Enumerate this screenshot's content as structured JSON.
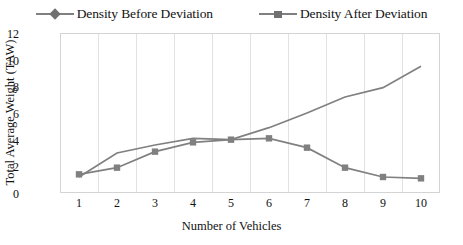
{
  "chart_data": {
    "type": "line",
    "title": "",
    "xlabel": "Number of Vehicles",
    "ylabel": "Total Average Weight (TAW)",
    "x": [
      1,
      2,
      3,
      4,
      5,
      6,
      7,
      8,
      9,
      10
    ],
    "xticklabels": [
      "1",
      "2",
      "3",
      "4",
      "5",
      "6",
      "7",
      "8",
      "9",
      "10"
    ],
    "yticklabels": [
      "0",
      "2",
      "4",
      "6",
      "8",
      "10",
      "12"
    ],
    "yticks": [
      0,
      2,
      4,
      6,
      8,
      10,
      12
    ],
    "ylim": [
      0,
      12
    ],
    "xlim": [
      0.5,
      10.5
    ],
    "grid": "vertical-only",
    "legend_position": "top-center",
    "series": [
      {
        "name": "Density Before Deviation",
        "marker": "diamond",
        "color": "#707070",
        "values": [
          1.2,
          3.0,
          3.6,
          4.1,
          4.0,
          4.9,
          6.0,
          7.2,
          7.9,
          9.5
        ]
      },
      {
        "name": "Density After Deviation",
        "marker": "square",
        "color": "#808080",
        "values": [
          1.4,
          1.9,
          3.1,
          3.8,
          4.0,
          4.1,
          3.4,
          1.9,
          1.2,
          1.1
        ]
      }
    ]
  },
  "legend": {
    "items": [
      {
        "label": "Density Before Deviation",
        "marker": "diamond"
      },
      {
        "label": "Density After Deviation",
        "marker": "square"
      }
    ]
  },
  "axes": {
    "x_title": "Number of Vehicles",
    "y_title": "Total Average Weight (TAW)"
  },
  "colors": {
    "series_line": "#808080",
    "marker_before": "#707070",
    "marker_after": "#808080",
    "gridline": "#e2e2e2",
    "frame": "#d4d4d4",
    "text": "#111111"
  }
}
